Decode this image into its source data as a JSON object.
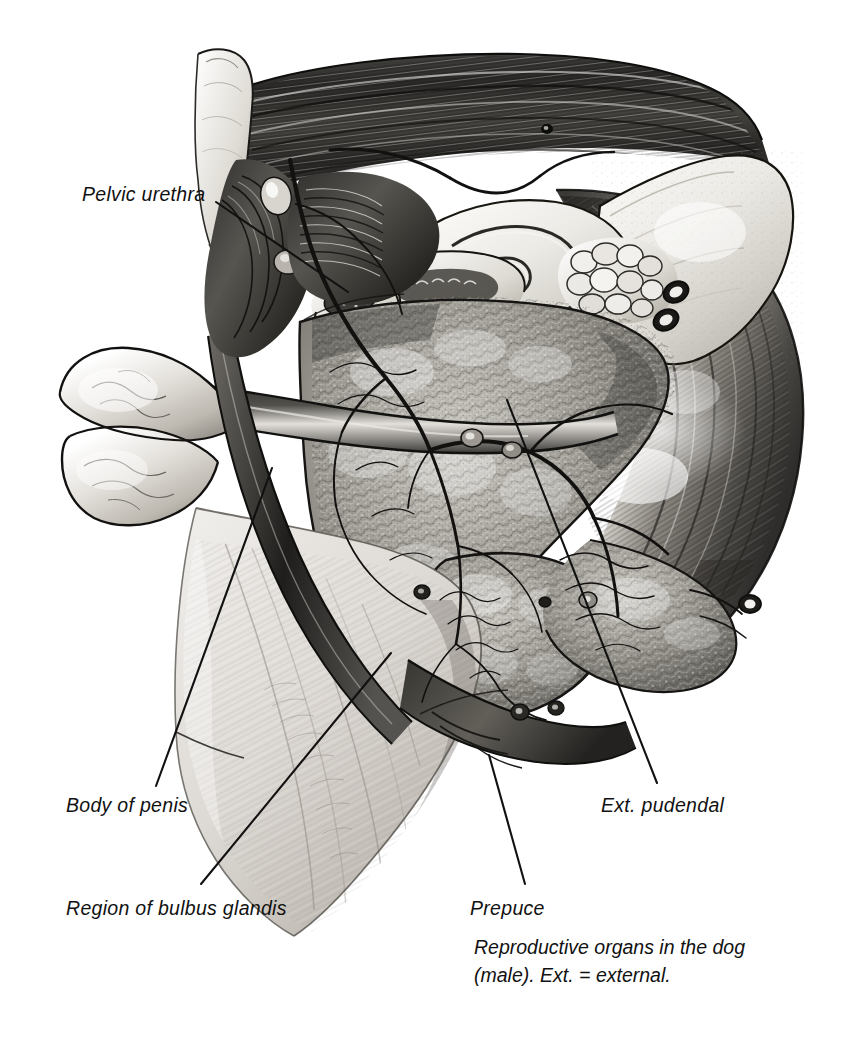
{
  "figure": {
    "kind": "anatomical-illustration",
    "medium": "grayscale pencil / airbrush rendering",
    "background_color": "#ffffff",
    "ink_color": "#111111",
    "tone_light": "#e8e6e4",
    "tone_mid": "#9a9893",
    "tone_dark": "#3b3a38",
    "tone_darkest": "#1d1c1b"
  },
  "annotations": [
    {
      "id": "pelvic-urethra",
      "label": "Pelvic urethra",
      "text_x": 82,
      "text_y": 197,
      "leader": {
        "x1": 216,
        "y1": 202,
        "x2": 348,
        "y2": 292
      }
    },
    {
      "id": "body-of-penis",
      "label": "Body of penis",
      "text_x": 66,
      "text_y": 808,
      "leader": {
        "x1": 272,
        "y1": 468,
        "x2": 156,
        "y2": 786
      }
    },
    {
      "id": "region-of-bulbus-glandis",
      "label": "Region of bulbus glandis",
      "text_x": 66,
      "text_y": 911,
      "leader": {
        "x1": 391,
        "y1": 653,
        "x2": 201,
        "y2": 884
      }
    },
    {
      "id": "prepuce",
      "label": "Prepuce",
      "text_x": 470,
      "text_y": 911,
      "leader": {
        "x1": 489,
        "y1": 755,
        "x2": 525,
        "y2": 884
      }
    },
    {
      "id": "ext-pudendal",
      "label": "Ext. pudendal",
      "text_x": 601,
      "text_y": 808,
      "leader": {
        "x1": 507,
        "y1": 400,
        "x2": 657,
        "y2": 783
      }
    }
  ],
  "caption": {
    "x": 474,
    "y": 934,
    "line1": "Reproductive organs in the dog",
    "line2": "(male). Ext. = external."
  }
}
